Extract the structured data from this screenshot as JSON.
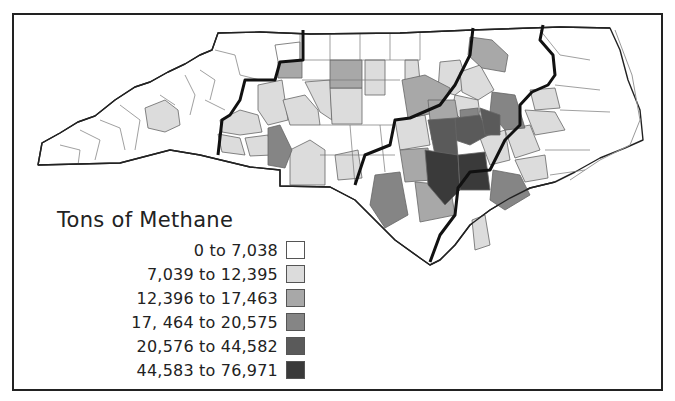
{
  "map": {
    "region": "North Carolina",
    "legend": {
      "title": "Tons of Methane",
      "items": [
        {
          "label": "0 to 7,038",
          "color": "#ffffff"
        },
        {
          "label": "7,039 to 12,395",
          "color": "#dcdcdc"
        },
        {
          "label": "12,396 to 17,463",
          "color": "#a8a8a8"
        },
        {
          "label": "17, 464 to 20,575",
          "color": "#858585"
        },
        {
          "label": "20,576 to 44,582",
          "color": "#5a5a5a"
        },
        {
          "label": "44,583 to 76,971",
          "color": "#3a3a3a"
        }
      ]
    },
    "colors": {
      "border": "#222222",
      "county_line": "#666666",
      "region_line": "#111111"
    }
  }
}
